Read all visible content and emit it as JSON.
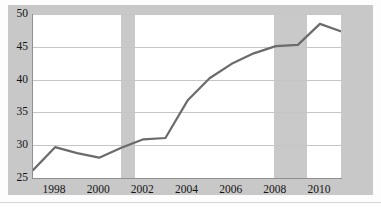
{
  "chart_data": {
    "type": "line",
    "title": "",
    "subtitle": "",
    "xlabel": "",
    "ylabel": "",
    "xlim": [
      1997,
      2011
    ],
    "ylim": [
      25,
      50
    ],
    "grid": true,
    "legend_position": "none",
    "y_ticks": [
      50,
      45,
      40,
      35,
      30,
      25
    ],
    "x_ticks": [
      1998,
      2000,
      2002,
      2004,
      2006,
      2008,
      2010
    ],
    "x_tick_labels": [
      "1998",
      "2000",
      "2002",
      "2004",
      "2006",
      "2008",
      "2010"
    ],
    "y_tick_labels": [
      "50",
      "45",
      "40",
      "35",
      "30",
      "25"
    ],
    "line_color": "#6b6b6b",
    "band_color": "#c9c9c9",
    "grid_color": "#c5c5c5",
    "x": [
      1997,
      1998,
      1999,
      2000,
      2001,
      2002,
      2003,
      2004,
      2005,
      2006,
      2007,
      2008,
      2009,
      2010,
      2011
    ],
    "values": [
      26.2,
      29.7,
      28.8,
      28.1,
      29.6,
      30.9,
      31.1,
      36.8,
      40.2,
      42.4,
      44.0,
      45.1,
      45.3,
      48.5,
      47.3
    ],
    "series": [
      {
        "name": "series-1",
        "values": [
          26.2,
          29.7,
          28.8,
          28.1,
          29.6,
          30.9,
          31.1,
          36.8,
          40.2,
          42.4,
          44.0,
          45.1,
          45.3,
          48.5,
          47.3
        ]
      }
    ],
    "shaded_bands": [
      {
        "start": 2001.0,
        "end": 2001.6
      },
      {
        "start": 2007.9,
        "end": 2009.4
      }
    ]
  }
}
